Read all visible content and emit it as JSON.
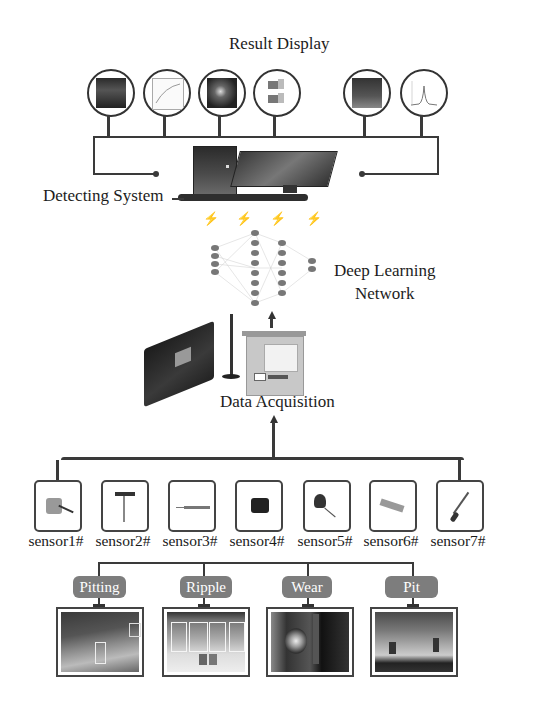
{
  "title": "Result Display",
  "detecting_system": {
    "label": "Detecting System"
  },
  "network": {
    "label_line1": "Deep Learning",
    "label_line2": "Network"
  },
  "data_acquisition": {
    "label": "Data Acquisition"
  },
  "result_icons": [
    {
      "name": "result-image-1",
      "kind": "dark-photo"
    },
    {
      "name": "result-image-2",
      "kind": "curve-plot"
    },
    {
      "name": "result-image-3",
      "kind": "dark-photo"
    },
    {
      "name": "result-image-4",
      "kind": "3d-blocks"
    },
    {
      "name": "result-image-5",
      "kind": "dark-photo"
    },
    {
      "name": "result-image-6",
      "kind": "peak-plot"
    }
  ],
  "sensors": [
    {
      "label": "sensor1#",
      "icon": "accelerometer-icon"
    },
    {
      "label": "sensor2#",
      "icon": "probe-sensor-icon"
    },
    {
      "label": "sensor3#",
      "icon": "rod-sensor-icon"
    },
    {
      "label": "sensor4#",
      "icon": "camera-icon"
    },
    {
      "label": "sensor5#",
      "icon": "acoustic-sensor-icon"
    },
    {
      "label": "sensor6#",
      "icon": "load-cell-icon"
    },
    {
      "label": "sensor7#",
      "icon": "temperature-probe-icon"
    }
  ],
  "defects": [
    {
      "label": "Pitting"
    },
    {
      "label": "Ripple"
    },
    {
      "label": "Wear"
    },
    {
      "label": "Pit"
    }
  ]
}
